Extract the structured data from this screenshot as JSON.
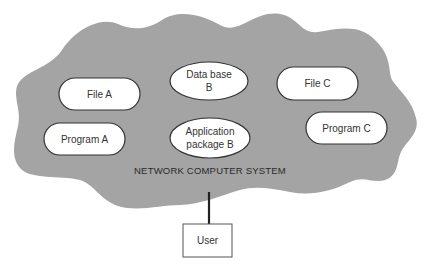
{
  "diagram": {
    "colors": {
      "cloud_fill": "#a4a4a4",
      "node_fill": "#ffffff",
      "node_stroke": "#333333",
      "line": "#222222",
      "background": "#ffffff"
    },
    "system": {
      "label": "NETWORK COMPUTER SYSTEM"
    },
    "resources": [
      {
        "id": "file-a",
        "shape": "rounded-pill",
        "lines": [
          "File A"
        ]
      },
      {
        "id": "database-b",
        "shape": "ellipse",
        "lines": [
          "Data base",
          "B"
        ]
      },
      {
        "id": "file-c",
        "shape": "rounded-pill",
        "lines": [
          "File C"
        ]
      },
      {
        "id": "program-a",
        "shape": "rounded-pill",
        "lines": [
          "Program A"
        ]
      },
      {
        "id": "application-package-b",
        "shape": "ellipse",
        "lines": [
          "Application",
          "package B"
        ]
      },
      {
        "id": "program-c",
        "shape": "rounded-pill",
        "lines": [
          "Program C"
        ]
      }
    ],
    "user": {
      "label": "User"
    },
    "connections": [
      {
        "from": "user",
        "to": "network-computer-system"
      }
    ]
  }
}
